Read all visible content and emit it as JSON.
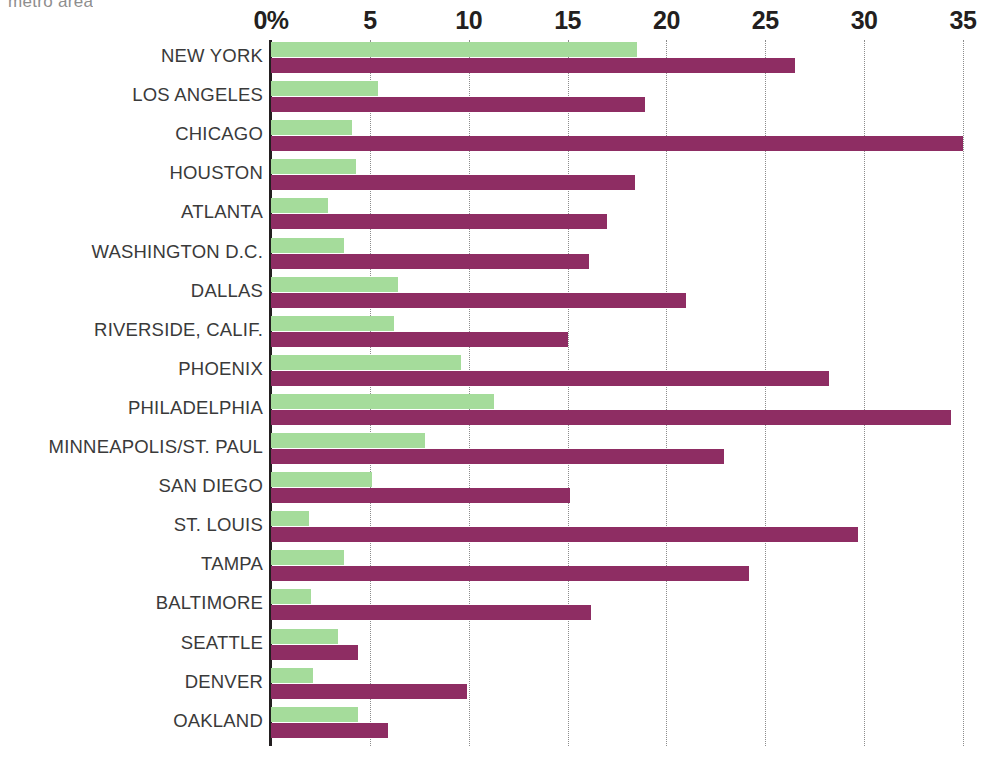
{
  "caption": "metro area",
  "colors": {
    "series_green": "#a5dc9b",
    "series_purple": "#8e2d63",
    "axis": "#231f20",
    "gridline": "#8c8c8c",
    "label_text": "#3a3a3a",
    "caption_text": "#8e8e8e"
  },
  "axis": {
    "ticks": [
      "0%",
      "5",
      "10",
      "15",
      "20",
      "25",
      "30",
      "35"
    ],
    "tick_values": [
      0,
      5,
      10,
      15,
      20,
      25,
      30,
      35
    ],
    "min": 0,
    "max": 35,
    "position": "top",
    "grid": true
  },
  "chart_data": {
    "type": "bar",
    "orientation": "horizontal",
    "title": "metro area",
    "subtitle": "",
    "xlabel": "",
    "ylabel": "",
    "xlim": [
      0,
      35
    ],
    "grid": true,
    "legend": "none",
    "categories": [
      "NEW YORK",
      "LOS ANGELES",
      "CHICAGO",
      "HOUSTON",
      "ATLANTA",
      "WASHINGTON D.C.",
      "DALLAS",
      "RIVERSIDE, CALIF.",
      "PHOENIX",
      "PHILADELPHIA",
      "MINNEAPOLIS/ST. PAUL",
      "SAN DIEGO",
      "ST. LOUIS",
      "TAMPA",
      "BALTIMORE",
      "SEATTLE",
      "DENVER",
      "OAKLAND"
    ],
    "series": [
      {
        "name": "green-series",
        "color": "#a5dc9b",
        "values": [
          18.5,
          5.4,
          4.1,
          4.3,
          2.9,
          3.7,
          6.4,
          6.2,
          9.6,
          11.3,
          7.8,
          5.1,
          1.9,
          3.7,
          2.0,
          3.4,
          2.1,
          4.4
        ]
      },
      {
        "name": "purple-series",
        "color": "#8e2d63",
        "values": [
          26.5,
          18.9,
          35.0,
          18.4,
          17.0,
          16.1,
          21.0,
          15.0,
          28.2,
          34.4,
          22.9,
          15.1,
          29.7,
          24.2,
          16.2,
          4.4,
          9.9,
          5.9
        ]
      }
    ]
  }
}
